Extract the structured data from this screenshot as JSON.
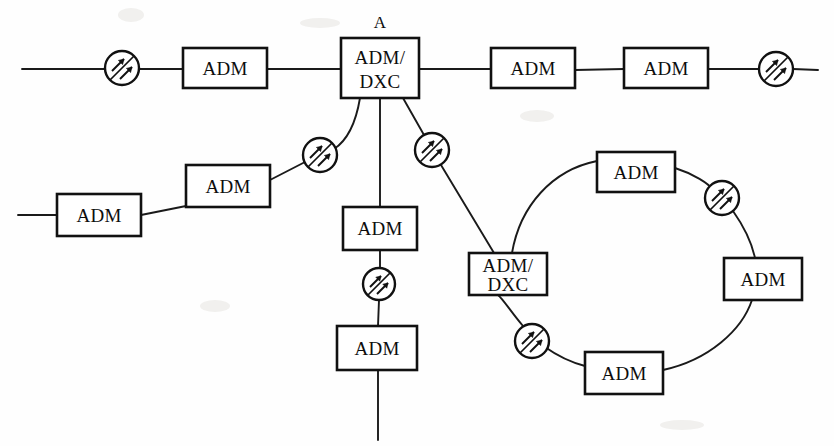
{
  "diagram": {
    "canvas": {
      "width": 834,
      "height": 446
    },
    "colors": {
      "background": "#fefefe",
      "stroke": "#111111",
      "box_fill": "#ffffff",
      "text": "#0d0d0d"
    },
    "labels": {
      "adm": "ADM",
      "adm_dxc_line1": "ADM/",
      "adm_dxc_line2": "DXC",
      "node_a": "A"
    },
    "legend_semantics": {
      "box": "add-drop multiplexer or digital cross-connect network element",
      "circle_with_arrows": "optical line amplifier"
    },
    "nodes": [
      {
        "id": "adm-top-1",
        "type": "adm",
        "label": "ADM",
        "x": 183,
        "y": 48,
        "w": 84,
        "h": 40
      },
      {
        "id": "adm-dxc-a",
        "type": "adm-dxc",
        "label": "ADM/DXC",
        "caption": "A",
        "x": 341,
        "y": 38,
        "w": 78,
        "h": 60
      },
      {
        "id": "adm-top-2",
        "type": "adm",
        "label": "ADM",
        "x": 491,
        "y": 48,
        "w": 84,
        "h": 40
      },
      {
        "id": "adm-top-3",
        "type": "adm",
        "label": "ADM",
        "x": 624,
        "y": 48,
        "w": 84,
        "h": 40
      },
      {
        "id": "adm-left-1",
        "type": "adm",
        "label": "ADM",
        "x": 57,
        "y": 194,
        "w": 84,
        "h": 42
      },
      {
        "id": "adm-left-2",
        "type": "adm",
        "label": "ADM",
        "x": 186,
        "y": 165,
        "w": 84,
        "h": 42
      },
      {
        "id": "adm-mid-1",
        "type": "adm",
        "label": "ADM",
        "x": 343,
        "y": 207,
        "w": 74,
        "h": 43
      },
      {
        "id": "adm-mid-2",
        "type": "adm",
        "label": "ADM",
        "x": 337,
        "y": 326,
        "w": 80,
        "h": 44
      },
      {
        "id": "adm-dxc-b",
        "type": "adm-dxc",
        "label": "ADM/DXC",
        "x": 469,
        "y": 253,
        "w": 78,
        "h": 42
      },
      {
        "id": "adm-ring-top",
        "type": "adm",
        "label": "ADM",
        "x": 597,
        "y": 152,
        "w": 78,
        "h": 40
      },
      {
        "id": "adm-ring-right",
        "type": "adm",
        "label": "ADM",
        "x": 724,
        "y": 258,
        "w": 78,
        "h": 42
      },
      {
        "id": "adm-ring-bottom",
        "type": "adm",
        "label": "ADM",
        "x": 585,
        "y": 352,
        "w": 78,
        "h": 42
      }
    ],
    "amplifiers": [
      {
        "id": "amp-top-left",
        "cx": 122,
        "cy": 68,
        "r": 17
      },
      {
        "id": "amp-top-right",
        "cx": 776,
        "cy": 69,
        "r": 17
      },
      {
        "id": "amp-left-branch",
        "cx": 320,
        "cy": 155,
        "r": 17
      },
      {
        "id": "amp-right-branch",
        "cx": 432,
        "cy": 150,
        "r": 17
      },
      {
        "id": "amp-mid-vert",
        "cx": 379,
        "cy": 284,
        "r": 16
      },
      {
        "id": "amp-ring-upper",
        "cx": 722,
        "cy": 198,
        "r": 17
      },
      {
        "id": "amp-ring-lower",
        "cx": 532,
        "cy": 341,
        "r": 17
      }
    ],
    "links": [
      {
        "id": "link-west-tail",
        "from": "west-edge",
        "to": "amp-top-left"
      },
      {
        "id": "link-amp-to-adm1",
        "from": "amp-top-left",
        "to": "adm-top-1"
      },
      {
        "id": "link-adm1-to-a",
        "from": "adm-top-1",
        "to": "adm-dxc-a"
      },
      {
        "id": "link-a-to-adm2",
        "from": "adm-dxc-a",
        "to": "adm-top-2"
      },
      {
        "id": "link-adm2-to-adm3",
        "from": "adm-top-2",
        "to": "adm-top-3"
      },
      {
        "id": "link-adm3-to-amp",
        "from": "adm-top-3",
        "to": "amp-top-right"
      },
      {
        "id": "link-amp-east-tail",
        "from": "amp-top-right",
        "to": "east-edge"
      },
      {
        "id": "link-a-left-branch",
        "from": "adm-dxc-a",
        "to": "amp-left-branch"
      },
      {
        "id": "link-amp-to-admleft2",
        "from": "amp-left-branch",
        "to": "adm-left-2"
      },
      {
        "id": "link-admleft2-to-admleft1",
        "from": "adm-left-2",
        "to": "adm-left-1"
      },
      {
        "id": "link-admleft1-tail",
        "from": "adm-left-1",
        "to": "west-edge-lower"
      },
      {
        "id": "link-a-vertical",
        "from": "adm-dxc-a",
        "to": "adm-mid-1"
      },
      {
        "id": "link-admmid1-to-amp",
        "from": "adm-mid-1",
        "to": "amp-mid-vert"
      },
      {
        "id": "link-amp-to-admmid2",
        "from": "amp-mid-vert",
        "to": "adm-mid-2"
      },
      {
        "id": "link-admmid2-tail",
        "from": "adm-mid-2",
        "to": "south-edge"
      },
      {
        "id": "link-a-right-branch",
        "from": "adm-dxc-a",
        "to": "amp-right-branch"
      },
      {
        "id": "link-amp-to-admdxcb",
        "from": "amp-right-branch",
        "to": "adm-dxc-b"
      },
      {
        "id": "ring-b-to-ringtop",
        "from": "adm-dxc-b",
        "to": "adm-ring-top"
      },
      {
        "id": "ring-ringtop-to-amp",
        "from": "adm-ring-top",
        "to": "amp-ring-upper"
      },
      {
        "id": "ring-amp-to-ringright",
        "from": "amp-ring-upper",
        "to": "adm-ring-right"
      },
      {
        "id": "ring-ringright-to-ringbottom",
        "from": "adm-ring-right",
        "to": "adm-ring-bottom"
      },
      {
        "id": "ring-ringbottom-to-amp",
        "from": "adm-ring-bottom",
        "to": "amp-ring-lower"
      },
      {
        "id": "ring-amp-to-b",
        "from": "amp-ring-lower",
        "to": "adm-dxc-b"
      }
    ],
    "counts": {
      "adm_nodes": 10,
      "adm_dxc_nodes": 2,
      "amplifiers": 7
    }
  }
}
